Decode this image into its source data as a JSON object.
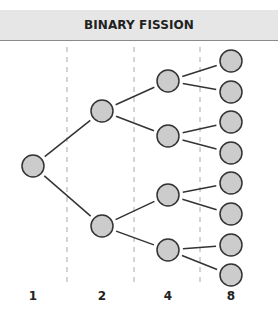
{
  "title": "BINARY FISSION",
  "generations": [
    {
      "label": "1",
      "x": 33,
      "cells_y": [
        166
      ]
    },
    {
      "label": "2",
      "x": 102,
      "cells_y": [
        111,
        226
      ]
    },
    {
      "label": "4",
      "x": 168,
      "cells_y": [
        81,
        136,
        195,
        250
      ]
    },
    {
      "label": "8",
      "x": 231,
      "cells_y": [
        61,
        92,
        122,
        153,
        183,
        214,
        245,
        275
      ]
    }
  ],
  "dividers_x": [
    67,
    134,
    200
  ],
  "colors": {
    "header_bg": "#e6e6e6",
    "cell_fill": "#cccccc",
    "cell_stroke": "#333333",
    "line": "#333333",
    "divider": "#aaaaaa"
  }
}
